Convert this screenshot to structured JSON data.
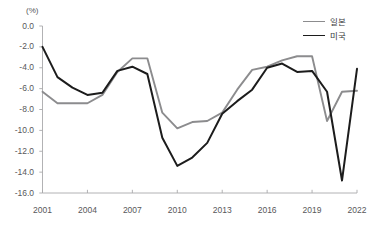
{
  "chart_data": {
    "type": "line",
    "title": "",
    "xlabel": "",
    "ylabel": "(%)",
    "unit_label": "(%)",
    "x": [
      2001,
      2002,
      2003,
      2004,
      2005,
      2006,
      2007,
      2008,
      2009,
      2010,
      2011,
      2012,
      2013,
      2014,
      2015,
      2016,
      2017,
      2018,
      2019,
      2020,
      2021,
      2022
    ],
    "xlim": [
      2001,
      2022
    ],
    "ylim": [
      -16.0,
      0.0
    ],
    "ytick_labels": [
      "0.0",
      "-2.0",
      "-4.0",
      "-6.0",
      "-8.0",
      "-10.0",
      "-12.0",
      "-14.0",
      "-16.0"
    ],
    "ytick_values": [
      0.0,
      -2.0,
      -4.0,
      -6.0,
      -8.0,
      -10.0,
      -12.0,
      -14.0,
      -16.0
    ],
    "xtick_labels": [
      "2001",
      "2004",
      "2007",
      "2010",
      "2013",
      "2016",
      "2019",
      "2022"
    ],
    "xtick_values": [
      2001,
      2004,
      2007,
      2010,
      2013,
      2016,
      2019,
      2022
    ],
    "grid": false,
    "legend_position": "top-right",
    "series": [
      {
        "name": "일본",
        "color": "#8c8c8e",
        "values": [
          -6.3,
          -7.4,
          -7.4,
          -7.4,
          -6.6,
          -4.4,
          -3.1,
          -3.1,
          -8.3,
          -9.8,
          -9.2,
          -9.1,
          -8.3,
          -6.1,
          -4.2,
          -3.9,
          -3.3,
          -2.9,
          -2.9,
          -9.1,
          -6.3,
          -6.2
        ]
      },
      {
        "name": "미국",
        "color": "#1c1c1c",
        "values": [
          -2.0,
          -4.9,
          -5.9,
          -6.6,
          -6.4,
          -4.3,
          -3.9,
          -4.6,
          -10.7,
          -13.4,
          -12.6,
          -11.2,
          -8.4,
          -7.2,
          -6.1,
          -4.0,
          -3.6,
          -4.4,
          -4.3,
          -6.3,
          -14.8,
          -4.1
        ]
      }
    ]
  },
  "legend": {
    "items": [
      {
        "label": "일본",
        "color": "#8c8c8e"
      },
      {
        "label": "미국",
        "color": "#1c1c1c"
      }
    ]
  }
}
